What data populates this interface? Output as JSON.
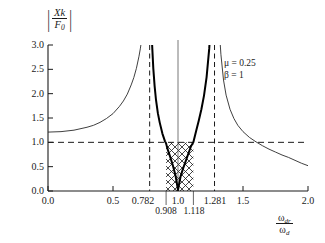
{
  "figure": {
    "name": "vibration-absorber-frequency-response",
    "background": "#ffffff",
    "ink": "#1a1a1a"
  },
  "chart_data": {
    "type": "line",
    "title": "",
    "xlabel_parts": {
      "numerator": "ω",
      "numerator_sub": "dr",
      "denominator": "ω",
      "denominator_sub": "d"
    },
    "ylabel_parts": {
      "numerator": "Xk",
      "denominator": "F",
      "denominator_sub": "0",
      "absolute_value": true
    },
    "xlim": [
      0.0,
      2.0
    ],
    "ylim": [
      0.0,
      3.0
    ],
    "grid": false,
    "x_ticks": [
      "0.0",
      "0.5",
      "1.0",
      "1.5",
      "2.0"
    ],
    "x_ticks_values": [
      0.0,
      0.5,
      1.0,
      1.5,
      2.0
    ],
    "x_extra_ticks": [
      "0.782",
      "1.281"
    ],
    "x_extra_ticks_values": [
      0.782,
      1.281
    ],
    "x_band_ticks": [
      "0.908",
      "1.118"
    ],
    "x_band_ticks_values": [
      0.908,
      1.118
    ],
    "y_ticks": [
      "0.0",
      "0.5",
      "1.0",
      "1.5",
      "2.0",
      "2.5",
      "3.0"
    ],
    "y_ticks_values": [
      0.0,
      0.5,
      1.0,
      1.5,
      2.0,
      2.5,
      3.0
    ],
    "series": [
      {
        "name": "primary-mass-response",
        "style": "thin-solid",
        "color": "#2a2a2a",
        "width": 0.9,
        "description": "Normalized primary mass amplitude; resonant asymptotes at 0.782 and 1.281",
        "x": [
          0.0,
          0.1,
          0.2,
          0.3,
          0.35,
          0.4,
          0.45,
          0.5,
          0.55,
          0.58,
          0.61,
          0.64,
          0.66,
          0.68,
          0.7,
          0.71,
          0.72,
          0.73,
          0.74,
          0.75,
          0.755,
          0.76,
          0.765,
          0.77,
          1.295,
          1.3,
          1.31,
          1.32,
          1.33,
          1.35,
          1.37,
          1.4,
          1.43,
          1.46,
          1.5,
          1.55,
          1.6,
          1.65,
          1.7,
          1.75,
          1.8,
          1.85,
          1.9,
          1.95,
          2.0
        ],
        "y": [
          1.21,
          1.22,
          1.25,
          1.31,
          1.35,
          1.41,
          1.49,
          1.59,
          1.74,
          1.85,
          1.99,
          2.18,
          2.33,
          2.52,
          2.77,
          2.92,
          3.1,
          3.33,
          3.6,
          3.95,
          4.17,
          4.43,
          4.75,
          5.12,
          5.3,
          4.7,
          3.8,
          3.22,
          2.81,
          2.28,
          1.97,
          1.68,
          1.49,
          1.35,
          1.22,
          1.1,
          1.01,
          0.93,
          0.86,
          0.8,
          0.74,
          0.69,
          0.63,
          0.57,
          0.52
        ]
      },
      {
        "name": "absorber-mass-response",
        "style": "thick-solid",
        "color": "#000000",
        "width": 2.0,
        "description": "Normalized absorber amplitude; zero at 1.0, asymptotes at 0.782 and 1.281",
        "x": [
          0.786,
          0.79,
          0.795,
          0.8,
          0.81,
          0.82,
          0.83,
          0.845,
          0.86,
          0.88,
          0.9,
          0.908,
          0.92,
          0.94,
          0.96,
          0.98,
          1.0,
          1.02,
          1.04,
          1.06,
          1.08,
          1.1,
          1.118,
          1.14,
          1.16,
          1.18,
          1.2,
          1.22,
          1.24,
          1.255,
          1.265,
          1.272,
          1.277
        ],
        "y": [
          4.6,
          3.95,
          3.45,
          3.05,
          2.52,
          2.16,
          1.89,
          1.6,
          1.4,
          1.18,
          1.02,
          0.98,
          0.86,
          0.7,
          0.53,
          0.33,
          0.02,
          0.3,
          0.47,
          0.62,
          0.77,
          0.92,
          1.0,
          1.24,
          1.45,
          1.68,
          1.96,
          2.34,
          2.92,
          3.55,
          4.15,
          4.8,
          5.4
        ]
      }
    ],
    "reference_lines": [
      {
        "name": "unity-amplitude-line",
        "orientation": "horizontal",
        "value": 1.0,
        "style": "dashed"
      },
      {
        "name": "lower-resonance-line",
        "orientation": "vertical",
        "value": 0.782,
        "style": "dashed"
      },
      {
        "name": "upper-resonance-line",
        "orientation": "vertical",
        "value": 1.281,
        "style": "dashed"
      },
      {
        "name": "tuned-frequency-line",
        "orientation": "vertical",
        "value": 1.0,
        "style": "solid-thin"
      }
    ],
    "shaded_region": {
      "name": "operating-band",
      "pattern": "cross-hatch",
      "x_start": 0.908,
      "x_end": 1.118,
      "y_start": 0.0,
      "y_end": 1.0
    },
    "annotations": [
      {
        "name": "mass-ratio",
        "text": "μ = 0.25"
      },
      {
        "name": "frequency-ratio",
        "text": "β = 1"
      }
    ]
  }
}
